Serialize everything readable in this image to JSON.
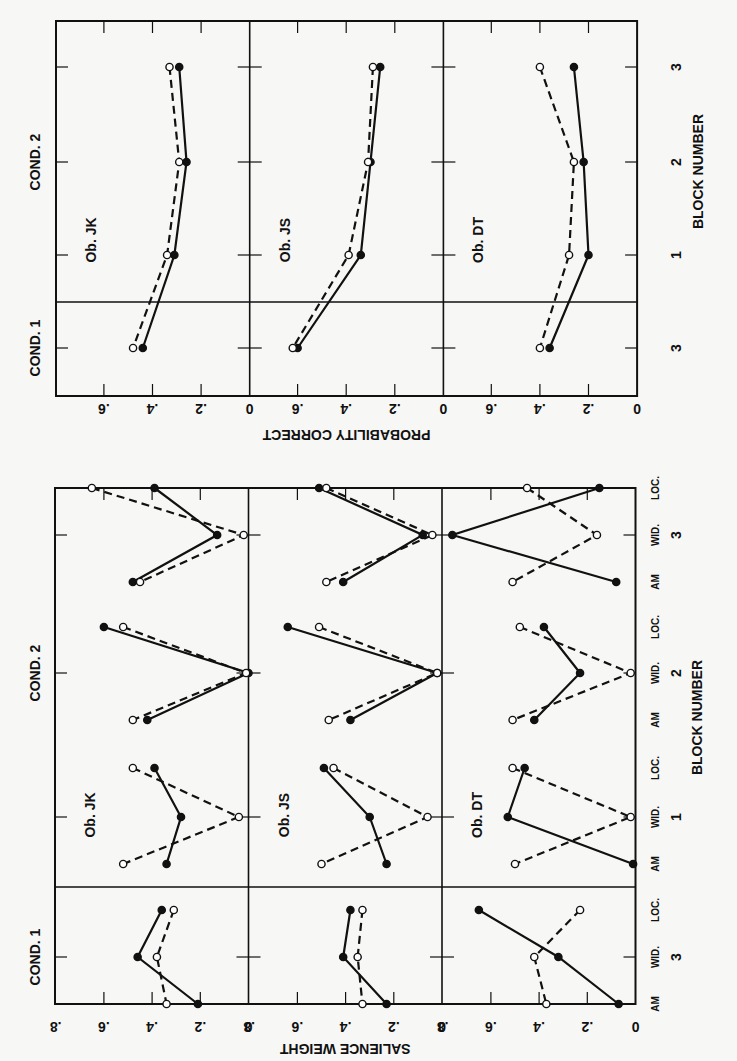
{
  "figure": {
    "width": 737,
    "height": 1061,
    "background": "#f7f7f5",
    "ink": "#111111"
  },
  "chart_data": [
    {
      "id": "probability-correct",
      "type": "line",
      "title": "",
      "xlabel": "BLOCK NUMBER",
      "ylabel": "PROBABILITY CORRECT",
      "ylim": [
        0,
        0.7
      ],
      "yticks": [
        0,
        0.2,
        0.4,
        0.6
      ],
      "ytick_labels": [
        "0",
        ".2",
        ".4",
        ".6"
      ],
      "conditions": [
        {
          "label": "COND. 2",
          "blocks": [
            "3",
            "2",
            "1"
          ]
        },
        {
          "label": "COND. 1",
          "blocks": [
            "3"
          ]
        }
      ],
      "categories": [
        "C2-B3",
        "C2-B2",
        "C2-B1",
        "C1-B3"
      ],
      "category_labels": [
        "3",
        "2",
        "1",
        "3"
      ],
      "legend": [
        {
          "name": "filled",
          "marker": "filled-circle",
          "line": "solid"
        },
        {
          "name": "open",
          "marker": "open-circle",
          "line": "dashed"
        }
      ],
      "panels": [
        {
          "label": "Ob. JK",
          "series": [
            {
              "name": "filled",
              "values": [
                0.29,
                0.26,
                0.31,
                0.44
              ]
            },
            {
              "name": "open",
              "values": [
                0.33,
                0.29,
                0.34,
                0.48
              ]
            }
          ]
        },
        {
          "label": "Ob. JS",
          "series": [
            {
              "name": "filled",
              "values": [
                0.26,
                0.3,
                0.34,
                0.6
              ]
            },
            {
              "name": "open",
              "values": [
                0.29,
                0.31,
                0.39,
                0.62
              ]
            }
          ]
        },
        {
          "label": "Ob. DT",
          "series": [
            {
              "name": "filled",
              "values": [
                0.26,
                0.22,
                0.2,
                0.36
              ]
            },
            {
              "name": "open",
              "values": [
                0.4,
                0.26,
                0.28,
                0.4
              ]
            }
          ]
        }
      ],
      "grid": false,
      "orientation": "rotated-90"
    },
    {
      "id": "salience-weight",
      "type": "line",
      "title": "",
      "xlabel": "BLOCK NUMBER",
      "ylabel": "SALIENCE WEIGHT",
      "ylim": [
        0,
        0.8
      ],
      "yticks": [
        0,
        0.2,
        0.4,
        0.6,
        0.8
      ],
      "ytick_labels": [
        "0",
        ".2",
        ".4",
        ".6",
        ".8"
      ],
      "conditions": [
        {
          "label": "COND. 2",
          "blocks": [
            "3",
            "2",
            "1"
          ]
        },
        {
          "label": "COND. 1",
          "blocks": [
            "3"
          ]
        }
      ],
      "dimension_labels": [
        "LOC.",
        "WID.",
        "AM"
      ],
      "categories": [
        "C2-B3-LOC",
        "C2-B3-WID",
        "C2-B3-AM",
        "C2-B2-LOC",
        "C2-B2-WID",
        "C2-B2-AM",
        "C2-B1-LOC",
        "C2-B1-WID",
        "C2-B1-AM",
        "C1-B3-LOC",
        "C1-B3-WID",
        "C1-B3-AM"
      ],
      "legend": [
        {
          "name": "filled",
          "marker": "filled-circle",
          "line": "solid"
        },
        {
          "name": "open",
          "marker": "open-circle",
          "line": "dashed"
        }
      ],
      "panels": [
        {
          "label": "Ob. JK",
          "series": [
            {
              "name": "filled",
              "values": [
                0.39,
                0.13,
                0.48,
                0.6,
                0.0,
                0.42,
                0.39,
                0.28,
                0.34,
                0.36,
                0.46,
                0.21
              ]
            },
            {
              "name": "open",
              "values": [
                0.65,
                0.02,
                0.45,
                0.52,
                0.01,
                0.48,
                0.48,
                0.04,
                0.52,
                0.31,
                0.38,
                0.34
              ]
            }
          ]
        },
        {
          "label": "Ob. JS",
          "series": [
            {
              "name": "filled",
              "values": [
                0.51,
                0.08,
                0.41,
                0.64,
                0.02,
                0.38,
                0.49,
                0.3,
                0.23,
                0.38,
                0.41,
                0.23
              ]
            },
            {
              "name": "open",
              "values": [
                0.48,
                0.04,
                0.48,
                0.51,
                0.02,
                0.47,
                0.45,
                0.06,
                0.5,
                0.33,
                0.35,
                0.33
              ]
            }
          ]
        },
        {
          "label": "Ob. DT",
          "series": [
            {
              "name": "filled",
              "values": [
                0.15,
                0.76,
                0.08,
                0.38,
                0.23,
                0.42,
                0.46,
                0.53,
                0.01,
                0.65,
                0.32,
                0.07
              ]
            },
            {
              "name": "open",
              "values": [
                0.45,
                0.16,
                0.51,
                0.48,
                0.02,
                0.51,
                0.51,
                0.02,
                0.5,
                0.23,
                0.42,
                0.37
              ]
            }
          ]
        }
      ],
      "grid": false,
      "orientation": "rotated-90"
    }
  ]
}
